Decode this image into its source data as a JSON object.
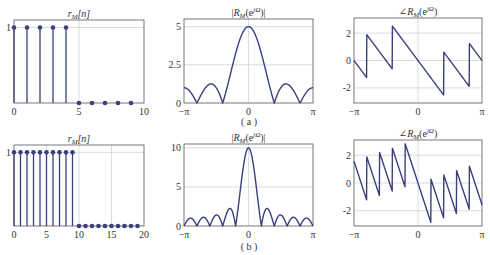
{
  "figure": {
    "captions": [
      "( a )",
      "( b )"
    ],
    "line_color": "#3b3f7c",
    "grid_color": "#cfd3dc",
    "axis_color": "#555555"
  },
  "chart_data": [
    {
      "id": "a-time",
      "type": "stem",
      "title": "r_M[n]",
      "title_main": "r",
      "title_sub": "M",
      "title_tail": "[n]",
      "x": [
        0,
        1,
        2,
        3,
        4,
        5,
        6,
        7,
        8,
        9
      ],
      "values": [
        1,
        1,
        1,
        1,
        1,
        0,
        0,
        0,
        0,
        0
      ],
      "xlim": [
        0,
        10
      ],
      "ylim": [
        0,
        1.1
      ],
      "xticks": [
        0,
        5,
        10
      ],
      "xticklabels": [
        "0",
        "5",
        "10"
      ],
      "yticks": [
        1
      ],
      "yticklabels": [
        "1"
      ],
      "grid": true
    },
    {
      "id": "a-mag",
      "type": "line",
      "title": "|R_M(e^{jω})|",
      "M": 5,
      "quantity": "magnitude",
      "xlim": [
        -3.14159,
        3.14159
      ],
      "ylim": [
        0,
        5.5
      ],
      "xticks": [
        -3.14159,
        0,
        3.14159
      ],
      "xticklabels": [
        "−π",
        "0",
        "π"
      ],
      "yticks": [
        0,
        2.5,
        5
      ],
      "yticklabels": [
        "0",
        "2.5",
        "5"
      ],
      "grid": true
    },
    {
      "id": "a-phase",
      "type": "line",
      "title": "∠R_M(e^{jω})",
      "M": 5,
      "quantity": "phase",
      "xlim": [
        -3.14159,
        3.14159
      ],
      "ylim": [
        -3.1,
        3.1
      ],
      "xticks": [
        -3.14159,
        0,
        3.14159
      ],
      "xticklabels": [
        "−π",
        "0",
        "π"
      ],
      "yticks": [
        -2,
        0,
        2
      ],
      "yticklabels": [
        "-2",
        "0",
        "2"
      ],
      "grid": true
    },
    {
      "id": "b-time",
      "type": "stem",
      "title": "r_M[n]",
      "title_main": "r",
      "title_sub": "M",
      "title_tail": "[n]",
      "x": [
        0,
        1,
        2,
        3,
        4,
        5,
        6,
        7,
        8,
        9,
        10,
        11,
        12,
        13,
        14,
        15,
        16,
        17,
        18,
        19
      ],
      "values": [
        1,
        1,
        1,
        1,
        1,
        1,
        1,
        1,
        1,
        1,
        0,
        0,
        0,
        0,
        0,
        0,
        0,
        0,
        0,
        0
      ],
      "xlim": [
        0,
        20
      ],
      "ylim": [
        0,
        1.1
      ],
      "xticks": [
        0,
        5,
        10,
        15,
        20
      ],
      "xticklabels": [
        "0",
        "5",
        "10",
        "15",
        "20"
      ],
      "yticks": [
        1
      ],
      "yticklabels": [
        "1"
      ],
      "grid": true
    },
    {
      "id": "b-mag",
      "type": "line",
      "title": "|R_M(e^{jω})|",
      "M": 10,
      "quantity": "magnitude",
      "xlim": [
        -3.14159,
        3.14159
      ],
      "ylim": [
        0,
        10.5
      ],
      "xticks": [
        -3.14159,
        0,
        3.14159
      ],
      "xticklabels": [
        "−π",
        "0",
        "π"
      ],
      "yticks": [
        0,
        5,
        10
      ],
      "yticklabels": [
        "0",
        "5",
        "10"
      ],
      "grid": true
    },
    {
      "id": "b-phase",
      "type": "line",
      "title": "∠R_M(e^{jω})",
      "M": 10,
      "quantity": "phase",
      "xlim": [
        -3.14159,
        3.14159
      ],
      "ylim": [
        -3.1,
        3.1
      ],
      "xticks": [
        -3.14159,
        0,
        3.14159
      ],
      "xticklabels": [
        "−π",
        "0",
        "π"
      ],
      "yticks": [
        -2,
        0,
        2
      ],
      "yticklabels": [
        "-2",
        "0",
        "2"
      ],
      "grid": true
    }
  ]
}
